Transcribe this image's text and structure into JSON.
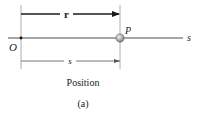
{
  "diagram": {
    "vector_label": "r",
    "point_label": "P",
    "origin_label": "O",
    "axis_label": "s",
    "distance_label": "s",
    "caption": "Position",
    "subfigure_label": "(a)",
    "colors": {
      "axis": "#8a8a8a",
      "arrow": "#1a1a1a",
      "guide": "#9a9a9a",
      "particle": "#9b9b9b"
    }
  }
}
